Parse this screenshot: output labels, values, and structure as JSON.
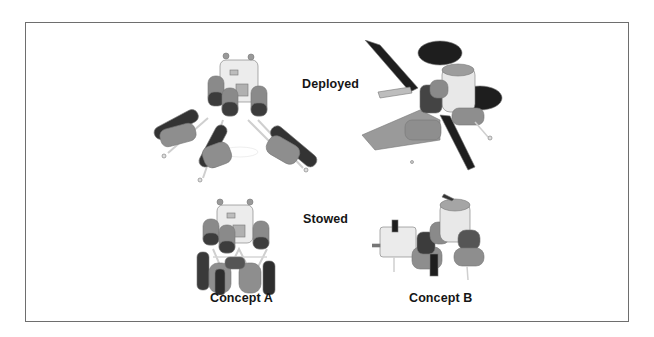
{
  "figure": {
    "row_labels": {
      "deployed": "Deployed",
      "stowed": "Stowed"
    },
    "column_labels": {
      "concept_a": "Concept A",
      "concept_b": "Concept B"
    },
    "illustrations": [
      {
        "id": "concept-a-deployed",
        "concept": "Concept A",
        "state": "Deployed"
      },
      {
        "id": "concept-b-deployed",
        "concept": "Concept B",
        "state": "Deployed"
      },
      {
        "id": "concept-a-stowed",
        "concept": "Concept A",
        "state": "Stowed"
      },
      {
        "id": "concept-b-stowed",
        "concept": "Concept B",
        "state": "Stowed"
      }
    ],
    "colors": {
      "frame": "#6e6e6e",
      "text": "#151515",
      "dark_tank": "#3a3a3a",
      "mid_tank": "#8c8c8c",
      "light_body": "#e4e4e4",
      "panel": "#1e1e1e"
    }
  }
}
